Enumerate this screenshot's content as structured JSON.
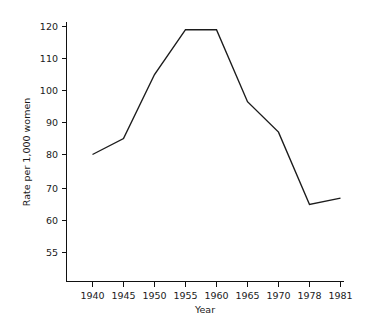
{
  "chart_data": {
    "type": "line",
    "title": "",
    "xlabel": "Year",
    "ylabel": "Rate per 1,000 women",
    "categories": [
      "1940",
      "1945",
      "1950",
      "1955",
      "1960",
      "1965",
      "1970",
      "1978",
      "1981"
    ],
    "values": [
      80,
      85,
      105,
      119,
      119,
      96.5,
      87,
      65,
      67
    ],
    "series": [
      {
        "name": "Rate per 1,000 women",
        "values": [
          80,
          85,
          105,
          119,
          119,
          96.5,
          87,
          65,
          67
        ]
      }
    ],
    "y_ticks": [
      120,
      110,
      100,
      90,
      80,
      70,
      60,
      55
    ],
    "y_tick_labels": [
      "120",
      "110",
      "100",
      "90",
      "80",
      "70",
      "60",
      "55"
    ],
    "x_tick_labels": [
      "1940",
      "1945",
      "1950",
      "1955",
      "1960",
      "1965",
      "1970",
      "1978",
      "1981"
    ],
    "ylim": [
      55,
      120
    ],
    "grid": false,
    "legend": "none",
    "note": "y-axis spacing is uneven below 60: the 60-to-55 interval occupies the same pixel height as the 10-unit intervals above it"
  },
  "axes": {
    "x_title": "Year",
    "y_title": "Rate per 1,000 women"
  }
}
